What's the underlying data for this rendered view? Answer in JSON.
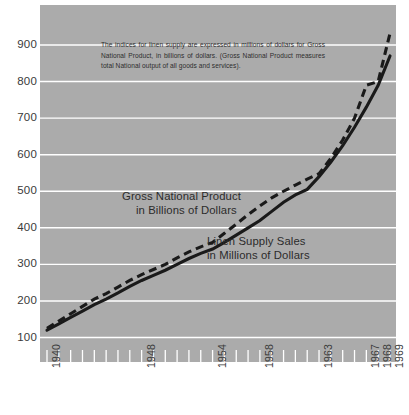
{
  "chart_data": {
    "type": "line",
    "title": "",
    "subtitle": "",
    "xlabel": "",
    "ylabel": "",
    "grid": true,
    "legend_position": "inline-annotations",
    "background_color": "#ababab",
    "gridline_color": "#ffffff",
    "line_color": "#1a1a1a",
    "xlim": [
      1940,
      1969
    ],
    "ylim": [
      100,
      960
    ],
    "yticks": [
      100,
      200,
      300,
      400,
      500,
      600,
      700,
      800,
      900
    ],
    "xticks": [
      1940,
      1948,
      1954,
      1958,
      1963,
      1967,
      1968,
      1969
    ],
    "x": [
      1940,
      1941,
      1942,
      1943,
      1944,
      1945,
      1946,
      1947,
      1948,
      1949,
      1950,
      1951,
      1952,
      1953,
      1954,
      1955,
      1956,
      1957,
      1958,
      1959,
      1960,
      1961,
      1962,
      1963,
      1964,
      1965,
      1966,
      1967,
      1968,
      1969
    ],
    "series": [
      {
        "name": "Gross National Product in Billions of Dollars",
        "style": "dashed",
        "values": [
          125,
          145,
          165,
          185,
          205,
          220,
          238,
          256,
          272,
          286,
          300,
          318,
          334,
          348,
          360,
          385,
          410,
          436,
          460,
          482,
          500,
          517,
          533,
          548,
          590,
          640,
          700,
          790,
          800,
          932
        ]
      },
      {
        "name": "Linen Supply Sales in Millions of Dollars",
        "style": "solid",
        "values": [
          120,
          137,
          155,
          172,
          190,
          205,
          222,
          240,
          256,
          270,
          284,
          300,
          316,
          330,
          342,
          360,
          380,
          400,
          420,
          445,
          470,
          490,
          505,
          540,
          580,
          625,
          675,
          730,
          790,
          870
        ]
      }
    ]
  },
  "annotation": {
    "note": "The indices for linen supply are expressed in millions of dollars for Gross National Product, in billions of dollars. (Gross National Product measures total National output of all goods and services)."
  },
  "captions": {
    "gnp_line_1": "Gross National Product",
    "gnp_line_2": "in Billions of Dollars",
    "linen_line_1": "Linen Supply Sales",
    "linen_line_2": "in Millions of Dollars"
  }
}
